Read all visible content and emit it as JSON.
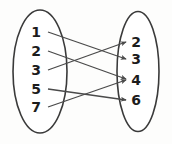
{
  "diagram": {
    "type": "arrow-mapping",
    "stroke_color": "#4a4a4a",
    "ellipse_stroke_color": "#3a3a3a",
    "label_color": "#1c1c1c",
    "background_color": "#fdfdfc",
    "domain_set": {
      "name": "left-oval",
      "cx": 40,
      "cy": 71.5,
      "rx": 27,
      "ry": 61.5,
      "elements": [
        {
          "label": "1",
          "x": 36,
          "y": 37,
          "anchor_x": 48,
          "anchor_y": 32
        },
        {
          "label": "2",
          "x": 36,
          "y": 56,
          "anchor_x": 48,
          "anchor_y": 51
        },
        {
          "label": "3",
          "x": 36,
          "y": 75,
          "anchor_x": 48,
          "anchor_y": 70
        },
        {
          "label": "5",
          "x": 36,
          "y": 94,
          "anchor_x": 48,
          "anchor_y": 89
        },
        {
          "label": "7",
          "x": 36,
          "y": 112,
          "anchor_x": 48,
          "anchor_y": 107
        }
      ]
    },
    "codomain_set": {
      "name": "right-oval",
      "cx": 138,
      "cy": 71.5,
      "rx": 21,
      "ry": 60,
      "elements": [
        {
          "label": "2",
          "x": 133,
          "y": 47,
          "anchor_x": 128,
          "anchor_y": 42
        },
        {
          "label": "3",
          "x": 133,
          "y": 64,
          "anchor_x": 128,
          "anchor_y": 59
        },
        {
          "label": "4",
          "x": 133,
          "y": 85,
          "anchor_x": 128,
          "anchor_y": 80
        },
        {
          "label": "6",
          "x": 133,
          "y": 105,
          "anchor_x": 128,
          "anchor_y": 100
        }
      ]
    },
    "arrows": [
      {
        "name": "arrow-1-to-3",
        "from": "1",
        "to": "3",
        "x1": 48,
        "y1": 32,
        "x2": 126,
        "y2": 59
      },
      {
        "name": "arrow-2-to-4",
        "from": "2",
        "to": "4",
        "x1": 48,
        "y1": 51,
        "x2": 126,
        "y2": 79
      },
      {
        "name": "arrow-3-to-2",
        "from": "3",
        "to": "2",
        "x1": 48,
        "y1": 70,
        "x2": 126,
        "y2": 42
      },
      {
        "name": "arrow-5-to-6",
        "from": "5",
        "to": "6",
        "x1": 48,
        "y1": 89,
        "x2": 126,
        "y2": 100
      },
      {
        "name": "arrow-7-to-4",
        "from": "7",
        "to": "4",
        "x1": 48,
        "y1": 107,
        "x2": 126,
        "y2": 80
      }
    ]
  }
}
